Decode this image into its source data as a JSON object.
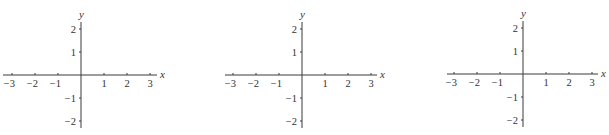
{
  "chart_data": [
    {
      "type": "line",
      "title": "",
      "xlabel": "x",
      "ylabel": "y",
      "xlim": [
        -3.3,
        3.3
      ],
      "ylim": [
        -2.3,
        2.3
      ],
      "grid": false,
      "x_ticks": [
        -3,
        -2,
        -1,
        1,
        2,
        3
      ],
      "y_ticks": [
        2,
        1,
        -1,
        -2
      ],
      "x_tick_labels": [
        "−3",
        "−2",
        "−1",
        "1",
        "2",
        "3"
      ],
      "y_tick_labels": [
        "2",
        "1",
        "−1",
        "−2"
      ],
      "series": []
    },
    {
      "type": "line",
      "title": "",
      "xlabel": "x",
      "ylabel": "y",
      "xlim": [
        -3.3,
        3.3
      ],
      "ylim": [
        -2.3,
        2.3
      ],
      "grid": false,
      "x_ticks": [
        -3,
        -2,
        -1,
        1,
        2,
        3
      ],
      "y_ticks": [
        2,
        1,
        -1,
        -2
      ],
      "x_tick_labels": [
        "−3",
        "−2",
        "−1",
        "1",
        "2",
        "3"
      ],
      "y_tick_labels": [
        "2",
        "1",
        "−1",
        "−2"
      ],
      "series": []
    },
    {
      "type": "line",
      "title": "",
      "xlabel": "x",
      "ylabel": "y",
      "xlim": [
        -3.3,
        3.3
      ],
      "ylim": [
        -2.3,
        2.3
      ],
      "grid": false,
      "x_ticks": [
        -3,
        -2,
        -1,
        1,
        2,
        3
      ],
      "y_ticks": [
        2,
        1,
        -1,
        -2
      ],
      "x_tick_labels": [
        "−3",
        "−2",
        "−1",
        "1",
        "2",
        "3"
      ],
      "y_tick_labels": [
        "2",
        "1",
        "−1",
        "−2"
      ],
      "series": []
    }
  ],
  "layout": {
    "plots": [
      {
        "origin_x": 81,
        "origin_y": 75,
        "unit_x": 23,
        "unit_y": 23,
        "x_start": 3,
        "x_end": 157,
        "y_top": 22,
        "y_bottom": 128
      },
      {
        "origin_x": 302,
        "origin_y": 75,
        "unit_x": 23,
        "unit_y": 23,
        "x_start": 225,
        "x_end": 377,
        "y_top": 22,
        "y_bottom": 128
      },
      {
        "origin_x": 523,
        "origin_y": 74,
        "unit_x": 23,
        "unit_y": 23,
        "x_start": 447,
        "x_end": 598,
        "y_top": 21,
        "y_bottom": 127
      }
    ]
  }
}
